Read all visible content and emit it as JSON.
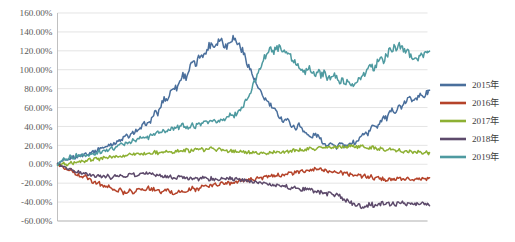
{
  "chart_data": {
    "type": "line",
    "title": "",
    "xlabel": "",
    "ylabel": "",
    "ylim": [
      -60,
      160
    ],
    "ytick_labels": [
      "160.00%",
      "140.00%",
      "120.00%",
      "100.00%",
      "80.00%",
      "60.00%",
      "40.00%",
      "20.00%",
      "0.00%",
      "-20.00%",
      "-40.00%",
      "-60.00%"
    ],
    "ytick_values": [
      160,
      140,
      120,
      100,
      80,
      60,
      40,
      20,
      0,
      -20,
      -40,
      -60
    ],
    "xtick_labels": [],
    "grid": true,
    "legend_position": "right",
    "x_count": 120,
    "series": [
      {
        "name": "2015年",
        "color": "#4a6f9c",
        "values": [
          0,
          2,
          4,
          3,
          6,
          8,
          7,
          10,
          9,
          12,
          11,
          14,
          13,
          16,
          18,
          17,
          20,
          22,
          21,
          25,
          24,
          28,
          30,
          29,
          33,
          36,
          35,
          40,
          44,
          42,
          48,
          55,
          53,
          62,
          70,
          68,
          76,
          83,
          80,
          88,
          95,
          92,
          100,
          108,
          104,
          112,
          118,
          115,
          124,
          128,
          125,
          130,
          133,
          128,
          124,
          132,
          134,
          130,
          126,
          120,
          112,
          104,
          96,
          88,
          80,
          74,
          70,
          66,
          62,
          58,
          54,
          50,
          46,
          48,
          44,
          40,
          38,
          42,
          38,
          34,
          30,
          28,
          32,
          30,
          26,
          22,
          20,
          24,
          20,
          18,
          22,
          20,
          18,
          20,
          24,
          22,
          26,
          30,
          34,
          32,
          38,
          42,
          40,
          46,
          50,
          48,
          54,
          58,
          56,
          62,
          60,
          66,
          70,
          68,
          72,
          70,
          74,
          72,
          76,
          78
        ],
        "end_value": 78
      },
      {
        "name": "2016年",
        "color": "#b5432a",
        "values": [
          0,
          -2,
          -4,
          -6,
          -5,
          -8,
          -10,
          -12,
          -14,
          -13,
          -16,
          -18,
          -20,
          -19,
          -22,
          -24,
          -23,
          -26,
          -25,
          -28,
          -27,
          -30,
          -29,
          -28,
          -30,
          -27,
          -26,
          -28,
          -26,
          -25,
          -27,
          -26,
          -28,
          -30,
          -29,
          -27,
          -29,
          -31,
          -30,
          -28,
          -30,
          -29,
          -27,
          -25,
          -27,
          -26,
          -24,
          -22,
          -24,
          -23,
          -21,
          -22,
          -20,
          -21,
          -19,
          -20,
          -18,
          -19,
          -17,
          -18,
          -16,
          -17,
          -15,
          -16,
          -14,
          -15,
          -13,
          -14,
          -12,
          -13,
          -11,
          -12,
          -10,
          -11,
          -9,
          -10,
          -8,
          -9,
          -7,
          -8,
          -6,
          -7,
          -5,
          -6,
          -5,
          -6,
          -7,
          -8,
          -7,
          -9,
          -8,
          -10,
          -9,
          -11,
          -10,
          -12,
          -11,
          -13,
          -12,
          -14,
          -13,
          -15,
          -14,
          -16,
          -15,
          -17,
          -16,
          -15,
          -16,
          -15,
          -17,
          -16,
          -15,
          -16,
          -17,
          -16,
          -15,
          -16,
          -15,
          -15
        ],
        "end_value": -15
      },
      {
        "name": "2017年",
        "color": "#8db033",
        "values": [
          0,
          0,
          1,
          0,
          2,
          1,
          3,
          2,
          4,
          3,
          5,
          4,
          6,
          5,
          6,
          7,
          6,
          8,
          7,
          9,
          8,
          10,
          9,
          11,
          10,
          11,
          12,
          11,
          12,
          13,
          12,
          13,
          12,
          13,
          14,
          13,
          14,
          13,
          14,
          15,
          14,
          15,
          14,
          15,
          16,
          15,
          16,
          15,
          16,
          17,
          16,
          15,
          16,
          15,
          14,
          15,
          14,
          13,
          14,
          13,
          12,
          13,
          12,
          13,
          12,
          11,
          12,
          11,
          12,
          13,
          12,
          13,
          14,
          13,
          14,
          15,
          14,
          15,
          16,
          15,
          16,
          17,
          16,
          17,
          18,
          17,
          18,
          17,
          18,
          19,
          18,
          19,
          18,
          19,
          20,
          19,
          18,
          19,
          18,
          17,
          18,
          17,
          16,
          17,
          16,
          15,
          16,
          15,
          14,
          15,
          14,
          13,
          14,
          13,
          12,
          13,
          12,
          13,
          12,
          12
        ],
        "end_value": 12
      },
      {
        "name": "2018年",
        "color": "#5d4a6b",
        "values": [
          0,
          -1,
          -3,
          -5,
          -4,
          -7,
          -9,
          -8,
          -11,
          -10,
          -12,
          -11,
          -13,
          -12,
          -14,
          -13,
          -12,
          -14,
          -13,
          -12,
          -11,
          -13,
          -12,
          -11,
          -10,
          -12,
          -11,
          -10,
          -9,
          -11,
          -10,
          -12,
          -11,
          -13,
          -12,
          -14,
          -13,
          -15,
          -14,
          -13,
          -15,
          -14,
          -16,
          -15,
          -14,
          -16,
          -15,
          -14,
          -16,
          -15,
          -17,
          -16,
          -15,
          -16,
          -15,
          -14,
          -16,
          -15,
          -17,
          -16,
          -18,
          -17,
          -19,
          -18,
          -20,
          -19,
          -21,
          -20,
          -22,
          -21,
          -23,
          -22,
          -24,
          -23,
          -25,
          -24,
          -26,
          -25,
          -27,
          -26,
          -28,
          -27,
          -29,
          -28,
          -30,
          -29,
          -31,
          -30,
          -32,
          -33,
          -34,
          -36,
          -38,
          -40,
          -42,
          -44,
          -43,
          -45,
          -44,
          -43,
          -42,
          -44,
          -43,
          -42,
          -41,
          -43,
          -42,
          -41,
          -42,
          -41,
          -40,
          -42,
          -41,
          -42,
          -43,
          -42,
          -41,
          -42,
          -41,
          -42
        ],
        "end_value": -42
      },
      {
        "name": "2019年",
        "color": "#4e9aa0",
        "values": [
          0,
          3,
          6,
          4,
          8,
          6,
          10,
          8,
          12,
          10,
          9,
          12,
          10,
          14,
          12,
          16,
          14,
          18,
          16,
          20,
          22,
          20,
          24,
          22,
          26,
          24,
          28,
          26,
          30,
          28,
          32,
          30,
          34,
          32,
          36,
          34,
          38,
          36,
          40,
          38,
          42,
          40,
          38,
          42,
          40,
          44,
          42,
          46,
          44,
          48,
          46,
          44,
          48,
          46,
          50,
          52,
          50,
          54,
          56,
          60,
          66,
          72,
          80,
          88,
          96,
          104,
          112,
          118,
          122,
          120,
          124,
          122,
          118,
          120,
          116,
          112,
          108,
          104,
          100,
          98,
          102,
          100,
          96,
          98,
          94,
          96,
          92,
          90,
          94,
          92,
          88,
          90,
          86,
          88,
          84,
          86,
          88,
          92,
          96,
          100,
          104,
          102,
          108,
          112,
          110,
          116,
          120,
          124,
          122,
          126,
          124,
          120,
          118,
          114,
          116,
          112,
          114,
          116,
          118,
          118
        ],
        "end_value": 118
      }
    ]
  },
  "legend": {
    "items": [
      {
        "label": "2015年",
        "color": "#4a6f9c"
      },
      {
        "label": "2016年",
        "color": "#b5432a"
      },
      {
        "label": "2017年",
        "color": "#8db033"
      },
      {
        "label": "2018年",
        "color": "#5d4a6b"
      },
      {
        "label": "2019年",
        "color": "#4e9aa0"
      }
    ]
  },
  "caption": {
    "text": ""
  }
}
